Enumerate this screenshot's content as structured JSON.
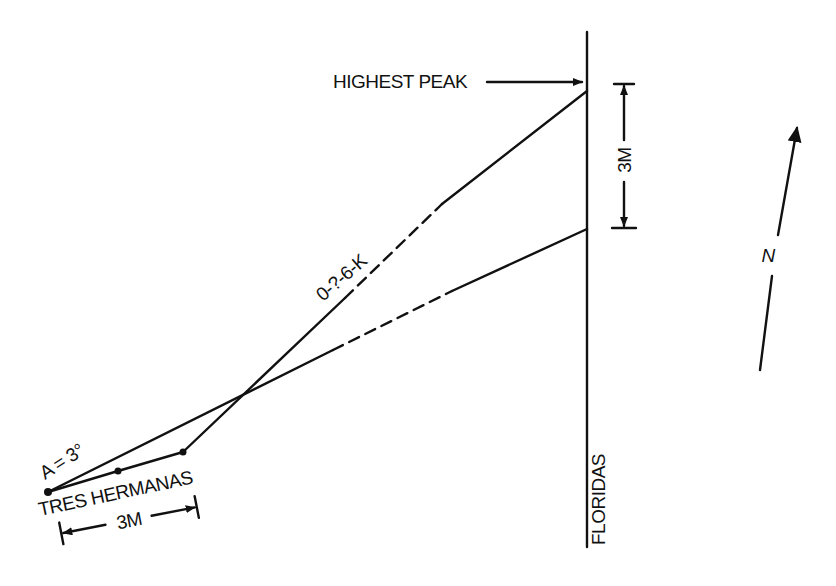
{
  "diagram": {
    "type": "survey-sighting-diagram",
    "labels": {
      "highest_peak": "HIGHEST PEAK",
      "vertical_scale": "3M",
      "sight_line": "0-?-6-K",
      "angle": "A = 3°",
      "base_station": "TRES HERMANAS",
      "base_scale": "3M",
      "reference_line": "FLORIDAS",
      "north": "N"
    },
    "colors": {
      "ink": "#111111",
      "background": "#ffffff"
    }
  }
}
